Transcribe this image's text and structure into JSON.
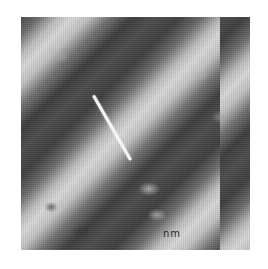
{
  "image": {
    "description": "Grayscale microscopy image with diagonal bright bands and a white line marker",
    "background_color": "#ffffff",
    "bands": {
      "dark": "#3c3c3c",
      "light": "#d9d9d9"
    },
    "marker": {
      "color": "#f4f4f4",
      "start": [
        92,
        96
      ],
      "end": [
        129,
        160
      ]
    },
    "scale_label": "nm"
  }
}
